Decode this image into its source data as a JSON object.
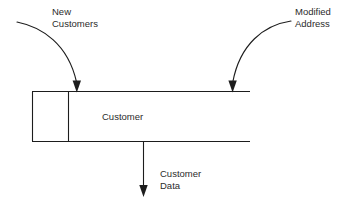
{
  "diagram": {
    "type": "data-flow-diagram",
    "notation": "data-store",
    "background_color": "#ffffff",
    "line_color": "#1d1d1d",
    "text_color": "#2b2b2b",
    "data_store": {
      "name": "Customer",
      "id_box_label": ""
    },
    "inflows": [
      {
        "id": "new-customers",
        "label_line1": "New",
        "label_line2": "Customers",
        "direction": "into-store"
      },
      {
        "id": "modified-address",
        "label_line1": "Modified",
        "label_line2": "Address",
        "direction": "into-store"
      }
    ],
    "outflows": [
      {
        "id": "customer-data",
        "label_line1": "Customer",
        "label_line2": "Data",
        "direction": "out-of-store"
      }
    ]
  }
}
